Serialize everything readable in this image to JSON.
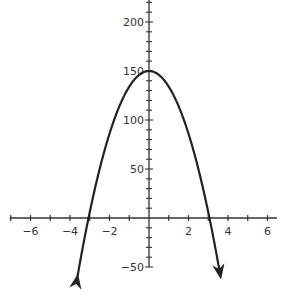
{
  "chart_data": {
    "type": "line",
    "title": "",
    "xlabel": "",
    "ylabel": "",
    "function": "y = -16x^2 + 150",
    "vertex": [
      0,
      150
    ],
    "x_intercepts": [
      -3.06,
      3.06
    ],
    "xlim": [
      -7,
      6.5
    ],
    "ylim": [
      -55,
      220
    ],
    "grid": false,
    "legend": null,
    "x_ticks": [
      -7,
      -6,
      -5,
      -4,
      -3,
      -2,
      -1,
      0,
      1,
      2,
      3,
      4,
      5,
      6
    ],
    "x_tick_labels": [
      "-6",
      "-4",
      "-2",
      "2",
      "4",
      "6"
    ],
    "x_tick_label_values": [
      -6,
      -4,
      -2,
      2,
      4,
      6
    ],
    "y_tick_step_minor": 10,
    "y_tick_labels": [
      "200",
      "150",
      "100",
      "50",
      "-50"
    ],
    "y_tick_label_values": [
      200,
      150,
      100,
      50,
      -50
    ],
    "series": [
      {
        "name": "parabola",
        "x": [
          -3.6,
          -3,
          -2.5,
          -2,
          -1.5,
          -1,
          -0.5,
          0,
          0.5,
          1,
          1.5,
          2,
          2.5,
          3,
          3.6
        ],
        "y": [
          -57.4,
          6,
          50,
          86,
          114,
          134,
          146,
          150,
          146,
          134,
          114,
          86,
          50,
          6,
          -57.4
        ],
        "arrows_at_ends": true
      }
    ],
    "colors": {
      "curve": "#222222",
      "axes": "#333333",
      "background": "#ffffff"
    }
  }
}
